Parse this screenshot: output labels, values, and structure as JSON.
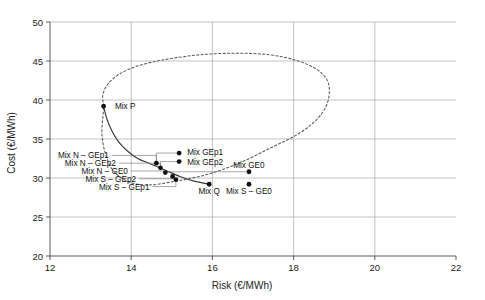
{
  "chart_data": {
    "type": "scatter",
    "title": "",
    "xlabel": "Risk (€/MWh)",
    "ylabel": "Cost (€/MWh)",
    "xlim": [
      12,
      22
    ],
    "ylim": [
      20,
      50
    ],
    "xticks": [
      "12",
      "14",
      "16",
      "18",
      "20",
      "22"
    ],
    "yticks": [
      "20",
      "25",
      "30",
      "35",
      "40",
      "45",
      "50"
    ],
    "grid": true,
    "legend": "none",
    "points": [
      {
        "name": "Mix P",
        "label": "Mix P",
        "x": 13.32,
        "y": 39.2,
        "label_x": 13.6,
        "label_y": 39.2,
        "anchor": "start",
        "leader": false
      },
      {
        "name": "Mix N - GEp1",
        "label": "Mix N – GEp1",
        "x": 14.62,
        "y": 31.9,
        "label_x": 13.45,
        "label_y": 32.9,
        "anchor": "end",
        "leader": true
      },
      {
        "name": "Mix N - GEp2",
        "label": "Mix N – GEp2",
        "x": 14.72,
        "y": 31.3,
        "label_x": 13.62,
        "label_y": 31.9,
        "anchor": "end",
        "leader": true
      },
      {
        "name": "Mix N - GE0",
        "label": "Mix N – GE0",
        "x": 14.84,
        "y": 30.7,
        "label_x": 13.92,
        "label_y": 30.9,
        "anchor": "end",
        "leader": true
      },
      {
        "name": "Mix S - GEp2",
        "label": "Mix S – GEp2",
        "x": 15.02,
        "y": 30.2,
        "label_x": 14.12,
        "label_y": 29.9,
        "anchor": "end",
        "leader": true
      },
      {
        "name": "Mix S - GEp1",
        "label": "Mix S – GEp1",
        "x": 15.1,
        "y": 29.8,
        "label_x": 14.45,
        "label_y": 28.9,
        "anchor": "end",
        "leader": true
      },
      {
        "name": "Mix GEp1",
        "label": "Mix GEp1",
        "x": 15.18,
        "y": 33.2,
        "label_x": 15.38,
        "label_y": 33.3,
        "anchor": "start",
        "leader": false
      },
      {
        "name": "Mix GEp2",
        "label": "Mix GEp2",
        "x": 15.18,
        "y": 32.1,
        "label_x": 15.38,
        "label_y": 32.1,
        "anchor": "start",
        "leader": false
      },
      {
        "name": "Mix Q",
        "label": "Mix Q",
        "x": 15.92,
        "y": 29.2,
        "label_x": 15.92,
        "label_y": 28.3,
        "anchor": "middle",
        "leader": false
      },
      {
        "name": "Mix GE0",
        "label": "Mix GE0",
        "x": 16.9,
        "y": 30.8,
        "label_x": 16.9,
        "label_y": 31.7,
        "anchor": "middle",
        "leader": false
      },
      {
        "name": "Mix S - GE0",
        "label": "Mix S – GE0",
        "x": 16.9,
        "y": 29.2,
        "label_x": 16.9,
        "label_y": 28.3,
        "anchor": "middle",
        "leader": false
      }
    ],
    "series": [
      {
        "name": "efficient-frontier",
        "style": "solid",
        "points": [
          [
            13.32,
            39.2
          ],
          [
            13.4,
            37.6
          ],
          [
            13.52,
            36.1
          ],
          [
            13.68,
            34.7
          ],
          [
            13.9,
            33.5
          ],
          [
            14.16,
            32.5
          ],
          [
            14.48,
            31.8
          ],
          [
            14.84,
            31.0
          ],
          [
            15.2,
            30.2
          ],
          [
            15.55,
            29.6
          ],
          [
            15.92,
            29.2
          ]
        ]
      },
      {
        "name": "feasible-region-boundary",
        "style": "dotted",
        "points": [
          [
            13.32,
            39.2
          ],
          [
            13.3,
            40.6
          ],
          [
            13.42,
            42.0
          ],
          [
            13.7,
            43.3
          ],
          [
            14.18,
            44.4
          ],
          [
            14.85,
            45.2
          ],
          [
            15.7,
            45.8
          ],
          [
            16.6,
            46.0
          ],
          [
            17.4,
            45.8
          ],
          [
            18.05,
            45.1
          ],
          [
            18.55,
            44.0
          ],
          [
            18.82,
            42.6
          ],
          [
            18.88,
            41.0
          ],
          [
            18.8,
            39.2
          ],
          [
            18.55,
            37.4
          ],
          [
            18.1,
            35.6
          ],
          [
            17.45,
            33.9
          ],
          [
            16.7,
            32.0
          ],
          [
            15.9,
            30.5
          ],
          [
            15.1,
            29.6
          ],
          [
            14.4,
            29.1
          ],
          [
            13.9,
            29.6
          ],
          [
            13.55,
            31.0
          ],
          [
            13.36,
            33.2
          ],
          [
            13.28,
            35.6
          ],
          [
            13.3,
            37.6
          ],
          [
            13.32,
            39.2
          ]
        ]
      }
    ],
    "leader_connectors": [
      {
        "name": "mix-gep1-connector",
        "x1": 15.18,
        "y1": 33.2,
        "x2": 14.62,
        "y2": 31.9
      },
      {
        "name": "mix-gep2-connector",
        "x1": 15.18,
        "y1": 32.1,
        "x2": 14.72,
        "y2": 31.3
      },
      {
        "name": "mix-ge0-connector",
        "x1": 16.9,
        "y1": 30.8,
        "x2": 14.84,
        "y2": 30.7
      }
    ]
  }
}
